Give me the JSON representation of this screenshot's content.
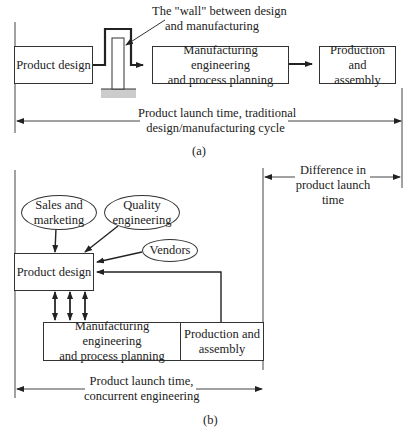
{
  "diagram_a": {
    "wall_label_line1": "The \"wall\" between design",
    "wall_label_line2": "and manufacturing",
    "boxes": {
      "product_design": "Product design",
      "mfg_eng_line1": "Manufacturing engineering",
      "mfg_eng_line2": "and process planning",
      "production_line1": "Production and",
      "production_line2": "assembly"
    },
    "timespan_line1": "Product launch time, traditional",
    "timespan_line2": "design/manufacturing cycle",
    "caption": "(a)"
  },
  "difference": {
    "line1": "Difference in",
    "line2": "product launch",
    "line3": "time"
  },
  "diagram_b": {
    "ellipses": {
      "sales_line1": "Sales and",
      "sales_line2": "marketing",
      "quality_line1": "Quality",
      "quality_line2": "engineering",
      "vendors": "Vendors"
    },
    "boxes": {
      "product_design": "Product design",
      "mfg_eng_line1": "Manufacturing engineering",
      "mfg_eng_line2": "and process planning",
      "production_line1": "Production and",
      "production_line2": "assembly"
    },
    "timespan_line1": "Product launch time,",
    "timespan_line2": "concurrent engineering",
    "caption": "(b)"
  }
}
